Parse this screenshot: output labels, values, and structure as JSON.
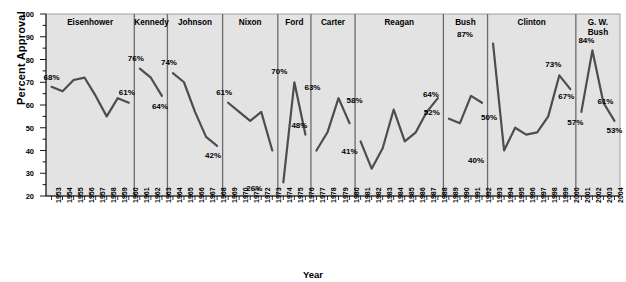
{
  "chart_data": {
    "type": "line",
    "title": "",
    "xlabel": "Year",
    "ylabel": "Percent Approval",
    "ylim": [
      20,
      100
    ],
    "ytick_step": 10,
    "yticks": [
      20,
      30,
      40,
      50,
      60,
      70,
      80,
      90,
      100
    ],
    "grid": false,
    "legend": "none",
    "plot_background": "#e3e3e3",
    "line_color": "#4d4d4d",
    "divider_color": "#6b6b6b",
    "x": [
      1953,
      1954,
      1955,
      1956,
      1957,
      1958,
      1959,
      1960,
      1961,
      1962,
      1963,
      1964,
      1965,
      1966,
      1967,
      1968,
      1969,
      1970,
      1971,
      1972,
      1973,
      1974,
      1975,
      1976,
      1977,
      1978,
      1979,
      1980,
      1981,
      1982,
      1983,
      1984,
      1985,
      1986,
      1987,
      1988,
      1989,
      1990,
      1991,
      1992,
      1993,
      1994,
      1995,
      1996,
      1997,
      1998,
      1999,
      2000,
      2001,
      2002,
      2003,
      2004
    ],
    "series": [
      {
        "name": "Presidential Approval",
        "values": [
          68,
          66,
          71,
          72,
          64,
          55,
          63,
          61,
          76,
          72,
          64,
          74,
          70,
          57,
          46,
          42,
          61,
          57,
          53,
          57,
          40,
          26,
          70,
          47,
          40,
          48,
          63,
          52,
          44,
          32,
          41,
          58,
          44,
          48,
          57,
          63,
          54,
          52,
          64,
          61,
          87,
          40,
          50,
          47,
          48,
          55,
          73,
          67,
          57,
          84,
          61,
          53
        ]
      }
    ],
    "annotations": [
      {
        "year": 1953,
        "value": 68,
        "text": "68%"
      },
      {
        "year": 1960,
        "value": 61,
        "text": "61%"
      },
      {
        "year": 1961,
        "value": 76,
        "text": "76%"
      },
      {
        "year": 1963,
        "value": 64,
        "text": "64%"
      },
      {
        "year": 1964,
        "value": 74,
        "text": "74%"
      },
      {
        "year": 1968,
        "value": 42,
        "text": "42%"
      },
      {
        "year": 1969,
        "value": 61,
        "text": "61%"
      },
      {
        "year": 1973,
        "value": 26,
        "text": "26%"
      },
      {
        "year": 1974,
        "value": 70,
        "text": "70%"
      },
      {
        "year": 1976,
        "value": 47,
        "text": "48%"
      },
      {
        "year": 1977,
        "value": 63,
        "text": "63%"
      },
      {
        "year": 1980,
        "value": 41,
        "text": "41%"
      },
      {
        "year": 1981,
        "value": 58,
        "text": "58%"
      },
      {
        "year": 1988,
        "value": 52,
        "text": "52%"
      },
      {
        "year": 1989,
        "value": 64,
        "text": "64%"
      },
      {
        "year": 1991,
        "value": 87,
        "text": "87%"
      },
      {
        "year": 1992,
        "value": 40,
        "text": "40%"
      },
      {
        "year": 1993,
        "value": 50,
        "text": "50%"
      },
      {
        "year": 1999,
        "value": 73,
        "text": "73%"
      },
      {
        "year": 2000,
        "value": 67,
        "text": "67%"
      },
      {
        "year": 2001,
        "value": 57,
        "text": "57%"
      },
      {
        "year": 2002,
        "value": 84,
        "text": "84%"
      },
      {
        "year": 2003,
        "value": 61,
        "text": "61%"
      },
      {
        "year": 2004,
        "value": 53,
        "text": "53%"
      }
    ],
    "panels": [
      {
        "label": "Eisenhower",
        "start": 1953,
        "end": 1960
      },
      {
        "label": "Kennedy",
        "start": 1961,
        "end": 1963
      },
      {
        "label": "Johnson",
        "start": 1964,
        "end": 1968
      },
      {
        "label": "Nixon",
        "start": 1969,
        "end": 1973
      },
      {
        "label": "Ford",
        "start": 1974,
        "end": 1976
      },
      {
        "label": "Carter",
        "start": 1977,
        "end": 1980
      },
      {
        "label": "Reagan",
        "start": 1981,
        "end": 1988
      },
      {
        "label": "Bush",
        "start": 1989,
        "end": 1992
      },
      {
        "label": "Clinton",
        "start": 1993,
        "end": 2000
      },
      {
        "label": "G. W.\nBush",
        "start": 2001,
        "end": 2004
      }
    ]
  }
}
